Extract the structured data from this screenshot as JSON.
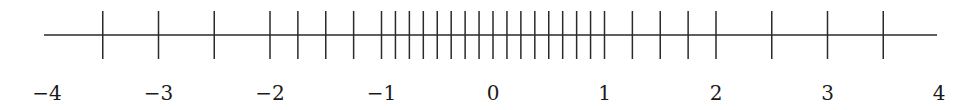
{
  "chart_data": {
    "type": "number-line",
    "title": "",
    "range": [
      -4,
      4
    ],
    "axis": {
      "pixel_origin_x": 493,
      "pixels_per_unit": 111.5,
      "line_y": 35,
      "line_start": -4,
      "line_end": 4
    },
    "tick_spacing_regions": [
      {
        "from": -3.5,
        "to": -2,
        "step": 0.5
      },
      {
        "from": -2,
        "to": -1,
        "step": 0.25
      },
      {
        "from": -1,
        "to": 1,
        "step": 0.125
      },
      {
        "from": 1,
        "to": 2,
        "step": 0.25
      },
      {
        "from": 2,
        "to": 3.5,
        "step": 0.5
      }
    ],
    "ticks": [
      -3.5,
      -3,
      -2.5,
      -2,
      -1.75,
      -1.5,
      -1.25,
      -1,
      -0.875,
      -0.75,
      -0.625,
      -0.5,
      -0.375,
      -0.25,
      -0.125,
      0,
      0.125,
      0.25,
      0.375,
      0.5,
      0.625,
      0.75,
      0.875,
      1,
      1.25,
      1.5,
      1.75,
      2,
      2.5,
      3,
      3.5
    ],
    "labels": [
      {
        "value": -4,
        "text": "−4"
      },
      {
        "value": -3,
        "text": "−3"
      },
      {
        "value": -2,
        "text": "−2"
      },
      {
        "value": -1,
        "text": "−1"
      },
      {
        "value": 0,
        "text": "0"
      },
      {
        "value": 1,
        "text": "1"
      },
      {
        "value": 2,
        "text": "2"
      },
      {
        "value": 3,
        "text": "3"
      },
      {
        "value": 4,
        "text": "4"
      }
    ],
    "tick_top_y": 11,
    "tick_bottom_y": 59,
    "label_baseline_y": 100,
    "colors": {
      "line": "#2a2a2a",
      "text": "#1a1a1a",
      "background": "#ffffff"
    }
  }
}
